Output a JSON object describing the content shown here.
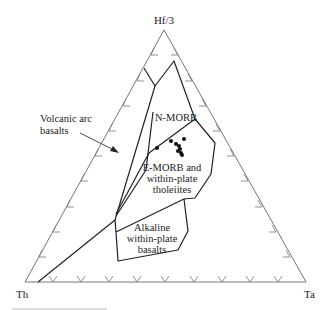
{
  "diagram": {
    "type": "ternary-discrimination",
    "apices": {
      "top": "Hf/3",
      "left": "Th",
      "right": "Ta"
    },
    "fields": [
      {
        "id": "volcanic-arc",
        "label_lines": [
          "Volcanic arc",
          "basalts"
        ]
      },
      {
        "id": "n-morb",
        "label_lines": [
          "N-MORB"
        ]
      },
      {
        "id": "e-morb",
        "label_lines": [
          "E-MORB and",
          "within-plate",
          "tholeiites"
        ]
      },
      {
        "id": "alkaline",
        "label_lines": [
          "Alkaline",
          "within-plate",
          "basalts"
        ]
      }
    ],
    "tick_divisions": 10,
    "data_points_px": [
      [
        157,
        148
      ],
      [
        171,
        141
      ],
      [
        184,
        139
      ],
      [
        176,
        144
      ],
      [
        179,
        146
      ],
      [
        180,
        149
      ],
      [
        178,
        151
      ],
      [
        181,
        153
      ],
      [
        182,
        155
      ]
    ]
  }
}
